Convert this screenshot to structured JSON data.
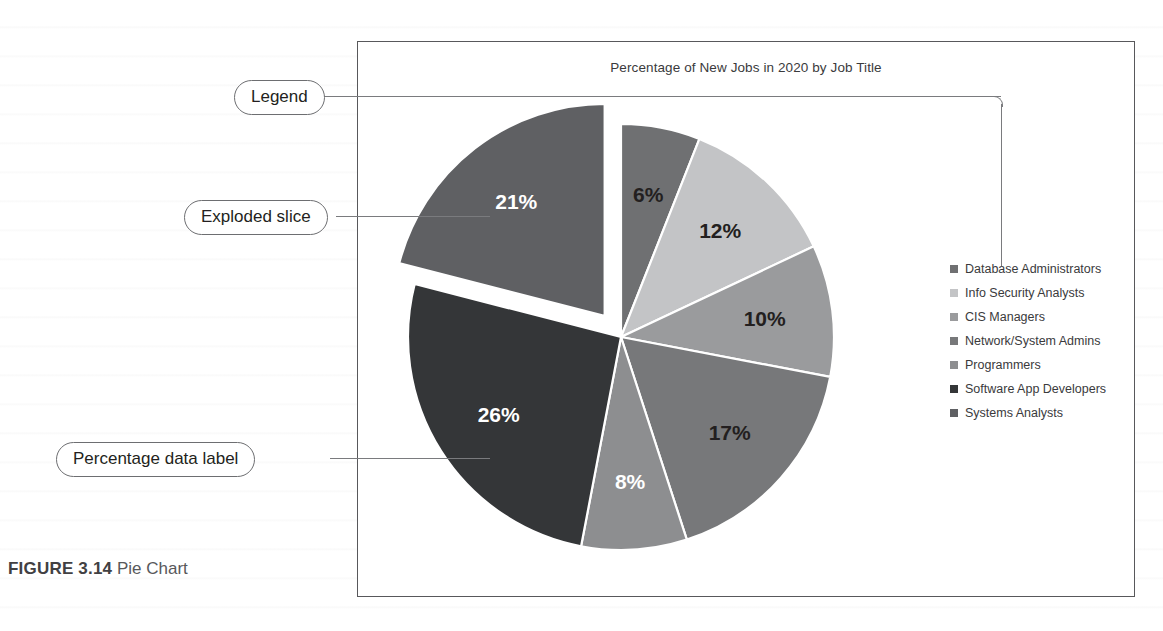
{
  "figure": {
    "number_label": "FIGURE 3.14",
    "caption": "Pie Chart"
  },
  "chart_data": {
    "type": "pie",
    "title": "Percentage of New Jobs in 2020 by Job Title",
    "categories": [
      "Database Administrators",
      "Info Security Analysts",
      "CIS Managers",
      "Network/System Admins",
      "Programmers",
      "Software App Developers",
      "Systems Analysts"
    ],
    "values": [
      6,
      12,
      10,
      17,
      8,
      26,
      21
    ],
    "data_labels": [
      "6%",
      "12%",
      "10%",
      "17%",
      "8%",
      "26%",
      "21%"
    ],
    "colors": [
      "#6f7072",
      "#c3c4c6",
      "#9a9b9d",
      "#77787a",
      "#8d8e90",
      "#343638",
      "#5f6063"
    ],
    "label_text_colors": [
      "dark",
      "dark",
      "dark",
      "dark",
      "light",
      "light",
      "light"
    ],
    "exploded_slice": "Systems Analysts",
    "legend_position": "right",
    "xlabel": "",
    "ylabel": ""
  },
  "annotations": [
    {
      "id": "legend",
      "label": "Legend"
    },
    {
      "id": "exploded-slice",
      "label": "Exploded slice"
    },
    {
      "id": "percentage-data-label",
      "label": "Percentage data label"
    }
  ]
}
